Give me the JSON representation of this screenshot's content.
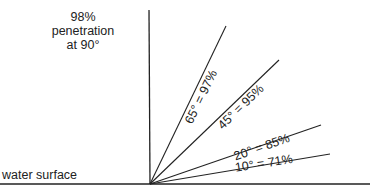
{
  "diagram": {
    "title_lines": [
      "98%",
      "penetration",
      "at 90°"
    ],
    "surface_label": "water surface",
    "rays": [
      {
        "angle": 90,
        "percent": 98
      },
      {
        "angle": 65,
        "percent": 97,
        "label": "65° = 97%"
      },
      {
        "angle": 45,
        "percent": 95,
        "label": "45° = 95%"
      },
      {
        "angle": 20,
        "percent": 85,
        "label": "20° = 85%"
      },
      {
        "angle": 10,
        "percent": 71,
        "label": "10° = 71%"
      }
    ],
    "colors": {
      "line": "#222222",
      "background": "#ffffff"
    }
  }
}
